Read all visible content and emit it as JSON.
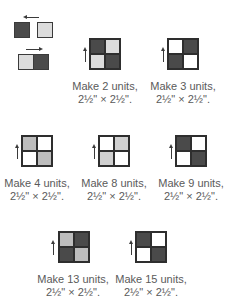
{
  "colors": {
    "dark": "#4a4a4a",
    "light_gray": "#d8d8d8",
    "medium_gray": "#bdbdbd",
    "white": "#ffffff",
    "border": "#2e2e2e"
  },
  "units": [
    {
      "caption_line1": "Make 2 units,",
      "caption_line2": "2½\" × 2½\"."
    },
    {
      "caption_line1": "Make 3 units,",
      "caption_line2": "2½\" × 2½\"."
    },
    {
      "caption_line1": "Make 4 units,",
      "caption_line2": "2½\" × 2½\"."
    },
    {
      "caption_line1": "Make 8 units,",
      "caption_line2": "2½\" × 2½\"."
    },
    {
      "caption_line1": "Make 9 units,",
      "caption_line2": "2½\" × 2½\"."
    },
    {
      "caption_line1": "Make 13 units,",
      "caption_line2": "2½\" × 2½\"."
    },
    {
      "caption_line1": "Make 15 units,",
      "caption_line2": "2½\" × 2½\"."
    }
  ]
}
